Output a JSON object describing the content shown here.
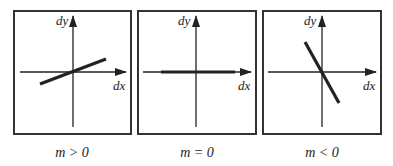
{
  "panels": [
    {
      "id": "positive-slope",
      "y_label": "dy",
      "x_label": "dx",
      "caption": "m > 0",
      "slope_sign": "positive"
    },
    {
      "id": "zero-slope",
      "y_label": "dy",
      "x_label": "dx",
      "caption": "m = 0",
      "slope_sign": "zero"
    },
    {
      "id": "negative-slope",
      "y_label": "dy",
      "x_label": "dx",
      "caption": "m < 0",
      "slope_sign": "negative"
    }
  ],
  "colors": {
    "stroke": "#222222",
    "frame": "#333333",
    "background": "#ffffff"
  }
}
